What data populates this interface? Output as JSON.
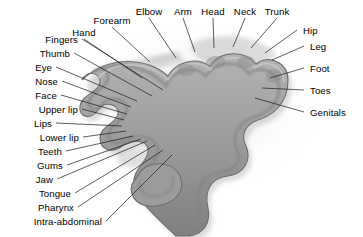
{
  "figure": {
    "background_color": "#ffffff",
    "cortex_fill": "#9a9a9a",
    "cortex_shade": "#7d7d7d",
    "cortex_outline": "#5d5d5d",
    "leader_line_color": "#1a1a1a",
    "label_color": "#000000",
    "width": 363,
    "height": 237
  },
  "labels": {
    "left": [
      {
        "text": "Fingers",
        "x": 78,
        "y": 39,
        "tip_x": 163,
        "tip_y": 90
      },
      {
        "text": "Thumb",
        "x": 70,
        "y": 53,
        "tip_x": 152,
        "tip_y": 96
      },
      {
        "text": "Eye",
        "x": 52,
        "y": 67,
        "tip_x": 137,
        "tip_y": 101
      },
      {
        "text": "Nose",
        "x": 58,
        "y": 81,
        "tip_x": 131,
        "tip_y": 107
      },
      {
        "text": "Face",
        "x": 57,
        "y": 95,
        "tip_x": 127,
        "tip_y": 114
      },
      {
        "text": "Upper lip",
        "x": 78,
        "y": 109,
        "tip_x": 124,
        "tip_y": 120
      },
      {
        "text": "Lips",
        "x": 52,
        "y": 123,
        "tip_x": 122,
        "tip_y": 126
      },
      {
        "text": "Lower lip",
        "x": 79,
        "y": 137,
        "tip_x": 126,
        "tip_y": 131
      },
      {
        "text": "Teeth",
        "x": 62,
        "y": 151,
        "tip_x": 133,
        "tip_y": 136
      },
      {
        "text": "Gums",
        "x": 63,
        "y": 165,
        "tip_x": 141,
        "tip_y": 139
      },
      {
        "text": "Jaw",
        "x": 53,
        "y": 179,
        "tip_x": 147,
        "tip_y": 141
      },
      {
        "text": "Tongue",
        "x": 71,
        "y": 193,
        "tip_x": 155,
        "tip_y": 145
      },
      {
        "text": "Pharynx",
        "x": 74,
        "y": 207,
        "tip_x": 163,
        "tip_y": 150
      },
      {
        "text": "Intra-abdominal",
        "x": 102,
        "y": 221,
        "tip_x": 172,
        "tip_y": 155
      }
    ],
    "top": [
      {
        "text": "Forearm",
        "x": 112,
        "y": 20,
        "tip_x": 150,
        "tip_y": 62
      },
      {
        "text": "Hand",
        "x": 84,
        "y": 32,
        "tip_x": 142,
        "tip_y": 78
      },
      {
        "text": "Elbow",
        "x": 149,
        "y": 11,
        "tip_x": 176,
        "tip_y": 58
      },
      {
        "text": "Arm",
        "x": 183,
        "y": 11,
        "tip_x": 195,
        "tip_y": 52
      },
      {
        "text": "Head",
        "x": 213,
        "y": 11,
        "tip_x": 214,
        "tip_y": 48
      },
      {
        "text": "Neck",
        "x": 245,
        "y": 11,
        "tip_x": 233,
        "tip_y": 47
      },
      {
        "text": "Trunk",
        "x": 277,
        "y": 11,
        "tip_x": 251,
        "tip_y": 48
      }
    ],
    "right": [
      {
        "text": "Hip",
        "x": 303,
        "y": 30,
        "tip_x": 265,
        "tip_y": 53
      },
      {
        "text": "Leg",
        "x": 310,
        "y": 46,
        "tip_x": 272,
        "tip_y": 60
      },
      {
        "text": "Foot",
        "x": 310,
        "y": 68,
        "tip_x": 270,
        "tip_y": 78
      },
      {
        "text": "Toes",
        "x": 310,
        "y": 90,
        "tip_x": 262,
        "tip_y": 88
      },
      {
        "text": "Genitals",
        "x": 310,
        "y": 112,
        "tip_x": 255,
        "tip_y": 98
      }
    ]
  }
}
